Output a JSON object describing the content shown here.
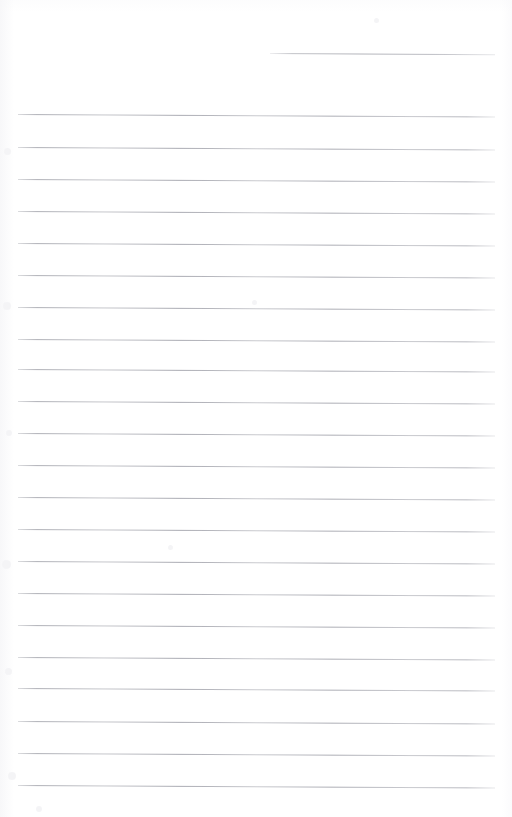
{
  "document": {
    "kind": "scanned-ruled-notebook-page",
    "title": "Blank ruled notebook page",
    "page_width": 512,
    "page_height": 817,
    "background_color": "#ffffff",
    "rule_color": "#b0b1b8",
    "rule_thickness_px": 1,
    "rule_spacing_px": 32,
    "rule_left_x": 18,
    "rule_right_x": 495,
    "skew_degrees": 0.3,
    "written_text": "",
    "rules": [
      {
        "id": "rule-partial-top",
        "y": 53,
        "x": 270,
        "width": 225,
        "partial": true
      },
      {
        "id": "rule-01",
        "y": 114,
        "x": 18,
        "width": 477,
        "partial": false
      },
      {
        "id": "rule-02",
        "y": 147,
        "x": 18,
        "width": 477,
        "partial": false
      },
      {
        "id": "rule-03",
        "y": 179,
        "x": 18,
        "width": 477,
        "partial": false
      },
      {
        "id": "rule-04",
        "y": 211,
        "x": 18,
        "width": 477,
        "partial": false
      },
      {
        "id": "rule-05",
        "y": 243,
        "x": 18,
        "width": 477,
        "partial": false
      },
      {
        "id": "rule-06",
        "y": 275,
        "x": 18,
        "width": 477,
        "partial": false
      },
      {
        "id": "rule-07",
        "y": 307,
        "x": 18,
        "width": 477,
        "partial": false
      },
      {
        "id": "rule-08",
        "y": 339,
        "x": 18,
        "width": 477,
        "partial": false
      },
      {
        "id": "rule-09",
        "y": 369,
        "x": 18,
        "width": 477,
        "partial": false
      },
      {
        "id": "rule-10",
        "y": 401,
        "x": 18,
        "width": 477,
        "partial": false
      },
      {
        "id": "rule-11",
        "y": 433,
        "x": 18,
        "width": 477,
        "partial": false
      },
      {
        "id": "rule-12",
        "y": 465,
        "x": 18,
        "width": 477,
        "partial": false
      },
      {
        "id": "rule-13",
        "y": 497,
        "x": 18,
        "width": 477,
        "partial": false
      },
      {
        "id": "rule-14",
        "y": 529,
        "x": 18,
        "width": 477,
        "partial": false
      },
      {
        "id": "rule-15",
        "y": 561,
        "x": 18,
        "width": 477,
        "partial": false
      },
      {
        "id": "rule-16",
        "y": 593,
        "x": 18,
        "width": 477,
        "partial": false
      },
      {
        "id": "rule-17",
        "y": 625,
        "x": 18,
        "width": 477,
        "partial": false
      },
      {
        "id": "rule-18",
        "y": 657,
        "x": 18,
        "width": 477,
        "partial": false
      },
      {
        "id": "rule-19",
        "y": 688,
        "x": 18,
        "width": 477,
        "partial": false
      },
      {
        "id": "rule-20",
        "y": 721,
        "x": 18,
        "width": 477,
        "partial": false
      },
      {
        "id": "rule-21",
        "y": 753,
        "x": 18,
        "width": 477,
        "partial": false
      },
      {
        "id": "rule-22",
        "y": 785,
        "x": 18,
        "width": 477,
        "partial": false
      }
    ],
    "specks": [
      {
        "x": 4,
        "y": 148,
        "size": 7
      },
      {
        "x": 3,
        "y": 302,
        "size": 8
      },
      {
        "x": 6,
        "y": 430,
        "size": 6
      },
      {
        "x": 2,
        "y": 560,
        "size": 9
      },
      {
        "x": 5,
        "y": 668,
        "size": 7
      },
      {
        "x": 8,
        "y": 772,
        "size": 8
      },
      {
        "x": 36,
        "y": 806,
        "size": 6
      },
      {
        "x": 252,
        "y": 300,
        "size": 5
      },
      {
        "x": 168,
        "y": 545,
        "size": 5
      },
      {
        "x": 374,
        "y": 18,
        "size": 5
      }
    ]
  }
}
